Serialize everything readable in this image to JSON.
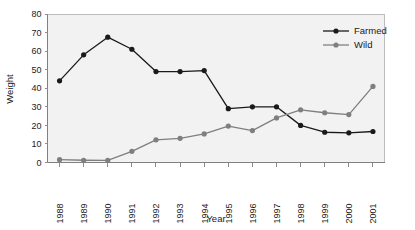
{
  "chart_data": {
    "type": "line",
    "title": "",
    "xlabel": "Year",
    "ylabel": "Weight",
    "categories": [
      "1988",
      "1989",
      "1990",
      "1991",
      "1992",
      "1993",
      "1994",
      "1995",
      "1996",
      "1997",
      "1998",
      "1999",
      "2000",
      "2001"
    ],
    "x": [
      1988,
      1989,
      1990,
      1991,
      1992,
      1993,
      1994,
      1995,
      1996,
      1997,
      1998,
      1999,
      2000,
      2001
    ],
    "series": [
      {
        "name": "Farmed",
        "color": "#1a1a1a",
        "marker": "circle",
        "values": [
          44,
          58,
          67.5,
          61,
          49,
          49,
          49.5,
          29,
          30,
          30,
          20,
          16.3,
          16,
          16.7
        ]
      },
      {
        "name": "Wild",
        "color": "#7f7f7f",
        "marker": "circle",
        "values": [
          1.5,
          1.2,
          1.1,
          6,
          12.2,
          13,
          15.4,
          19.6,
          17.2,
          24,
          28.4,
          26.8,
          25.8,
          41
        ]
      }
    ],
    "ylim": [
      0,
      80
    ],
    "yticks": [
      0,
      10,
      20,
      30,
      40,
      50,
      60,
      70,
      80
    ],
    "ytick_labels": [
      "0",
      "10",
      "20",
      "30",
      "40",
      "50",
      "60",
      "70",
      "80"
    ],
    "grid": false,
    "legend_position": "top-right",
    "legend": [
      "Farmed",
      "Wild"
    ],
    "plot_background": "#f2f2f2",
    "xtick_rotation": -90
  },
  "labels": {
    "y_axis_title": "Weight",
    "x_axis_title": "Year",
    "legend_farmed": "Farmed",
    "legend_wild": "Wild"
  },
  "ticks": {
    "y": [
      "0",
      "10",
      "20",
      "30",
      "40",
      "50",
      "60",
      "70",
      "80"
    ],
    "x": [
      "1988",
      "1989",
      "1990",
      "1991",
      "1992",
      "1993",
      "1994",
      "1995",
      "1996",
      "1997",
      "1998",
      "1999",
      "2000",
      "2001"
    ]
  }
}
